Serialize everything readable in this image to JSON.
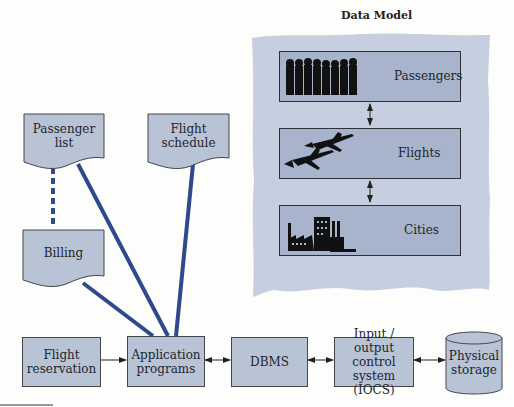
{
  "data_model": {
    "title": "Data Model",
    "entities": [
      {
        "label": "Passengers",
        "icon": "people-silhouette-icon"
      },
      {
        "label": "Flights",
        "icon": "airplanes-icon"
      },
      {
        "label": "Cities",
        "icon": "factory-city-icon"
      }
    ]
  },
  "documents": {
    "passenger_list": {
      "line1": "Passenger",
      "line2": "list"
    },
    "flight_schedule": {
      "line1": "Flight",
      "line2": "schedule"
    },
    "billing": {
      "line1": "Billing"
    }
  },
  "pipeline": {
    "flight_reservation": {
      "line1": "Flight",
      "line2": "reservation"
    },
    "application_programs": {
      "line1": "Application",
      "line2": "programs"
    },
    "dbms": {
      "line1": "DBMS"
    },
    "iocs": {
      "line1": "Input / output",
      "line2": "control system",
      "line3": "(IOCS)"
    },
    "physical_storage": {
      "line1": "Physical",
      "line2": "storage"
    }
  },
  "colors": {
    "box_fill": "#b8c3d6",
    "panel_fill": "#c5cfe0",
    "connector_line": "#2f4a8c"
  }
}
